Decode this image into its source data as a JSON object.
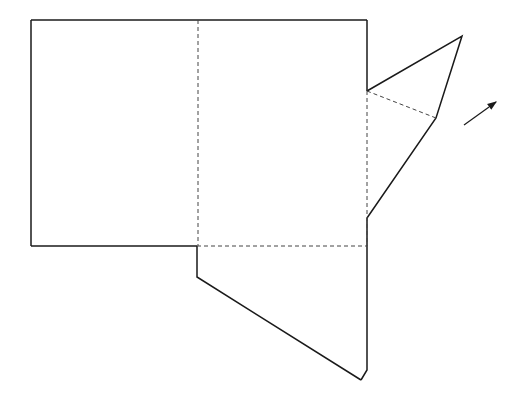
{
  "diagram": {
    "stroke_color": "#1a1a1a",
    "solid_edges": [
      {
        "name": "left-face-top",
        "points": [
          [
            31,
            20
          ],
          [
            367,
            20
          ]
        ]
      },
      {
        "name": "left-face-left",
        "points": [
          [
            31,
            20
          ],
          [
            31,
            246
          ]
        ]
      },
      {
        "name": "left-face-bottom",
        "points": [
          [
            31,
            246
          ],
          [
            197,
            246
          ]
        ]
      },
      {
        "name": "right-edge-upper",
        "points": [
          [
            367,
            20
          ],
          [
            367,
            91
          ]
        ]
      },
      {
        "name": "top-flap",
        "points": [
          [
            367,
            91
          ],
          [
            462,
            36
          ],
          [
            436,
            118
          ],
          [
            367,
            218
          ]
        ]
      },
      {
        "name": "right-edge-lower",
        "points": [
          [
            367,
            218
          ],
          [
            367,
            370
          ],
          [
            361,
            380
          ]
        ]
      },
      {
        "name": "bottom-flap",
        "points": [
          [
            197,
            246
          ],
          [
            197,
            277
          ],
          [
            361,
            380
          ]
        ]
      }
    ],
    "dashed_edges": [
      {
        "name": "fold-vertical",
        "points": [
          [
            198,
            20
          ],
          [
            198,
            246
          ]
        ]
      },
      {
        "name": "fold-horizontal",
        "points": [
          [
            197,
            246
          ],
          [
            367,
            246
          ]
        ]
      },
      {
        "name": "fold-right",
        "points": [
          [
            367,
            91
          ],
          [
            367,
            246
          ]
        ]
      },
      {
        "name": "fold-flap",
        "points": [
          [
            367,
            91
          ],
          [
            436,
            118
          ]
        ]
      }
    ],
    "arrow": {
      "from": [
        464,
        125
      ],
      "to": [
        496,
        102
      ]
    }
  }
}
